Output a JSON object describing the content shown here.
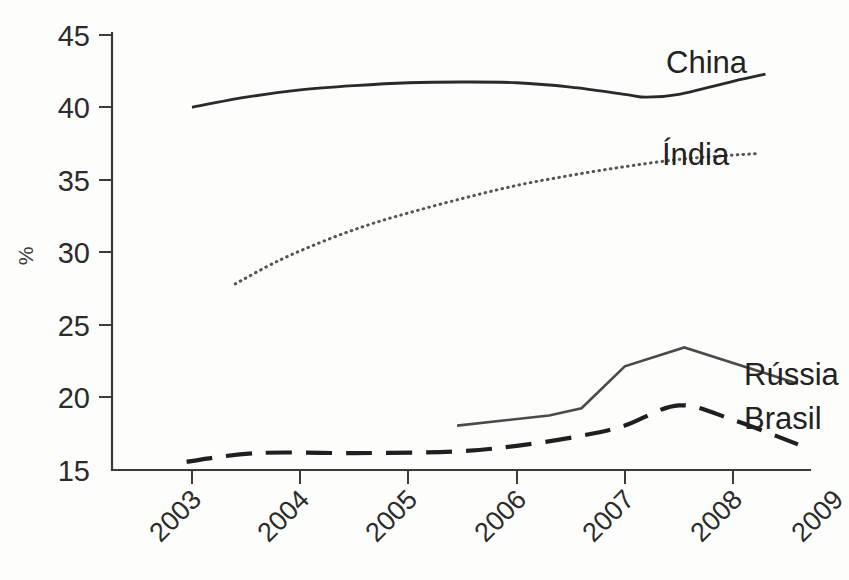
{
  "chart_data": {
    "type": "line",
    "title": "",
    "subtitle": "",
    "xlabel": "",
    "ylabel": "%",
    "xlim": [
      2003,
      2009
    ],
    "ylim": [
      15,
      45
    ],
    "grid": false,
    "legend_position": "right-inline",
    "x_ticks": [
      "2003",
      "2004",
      "2005",
      "2006",
      "2007",
      "2008",
      "2009"
    ],
    "y_ticks": [
      "15",
      "20",
      "25",
      "30",
      "35",
      "40",
      "45"
    ],
    "series": [
      {
        "name": "China",
        "style": "solid",
        "color": "#2a2a2a",
        "label_x": 2009.0,
        "label_value": 42.9,
        "x": [
          2003.0,
          2003.5,
          2004.0,
          2004.5,
          2005.0,
          2005.5,
          2006.0,
          2006.5,
          2007.0,
          2007.2,
          2007.5,
          2008.0,
          2008.3
        ],
        "values": [
          40.0,
          40.7,
          41.2,
          41.5,
          41.7,
          41.75,
          41.7,
          41.4,
          40.9,
          40.7,
          40.9,
          41.8,
          42.3
        ]
      },
      {
        "name": "Índia",
        "style": "dotted",
        "color": "#555555",
        "label_x": 2009.05,
        "label_value": 37.2,
        "x": [
          2003.4,
          2003.8,
          2004.2,
          2004.6,
          2005.0,
          2005.5,
          2006.0,
          2006.5,
          2007.0,
          2007.5,
          2008.0,
          2008.25
        ],
        "values": [
          27.8,
          29.4,
          30.7,
          31.8,
          32.7,
          33.7,
          34.6,
          35.3,
          35.9,
          36.4,
          36.7,
          36.8
        ]
      },
      {
        "name": "Rússia",
        "style": "solid",
        "color": "#4a4a4a",
        "label_x": 2009.1,
        "label_value": 21.2,
        "x": [
          2005.45,
          2006.3,
          2006.6,
          2007.0,
          2007.55,
          2008.6
        ],
        "values": [
          18.0,
          18.7,
          19.2,
          22.1,
          23.4,
          20.9
        ]
      },
      {
        "name": "Brasil",
        "style": "dashed",
        "color": "#1f1f1f",
        "label_x": 2009.1,
        "label_value": 18.5,
        "x": [
          2002.95,
          2003.6,
          2004.5,
          2005.4,
          2006.0,
          2006.6,
          2007.0,
          2007.5,
          2008.0,
          2008.6
        ],
        "values": [
          15.5,
          16.1,
          16.1,
          16.2,
          16.6,
          17.3,
          18.0,
          19.4,
          18.4,
          16.7
        ]
      }
    ]
  },
  "axes": {
    "y_axis_label": "%",
    "y_tick_labels": [
      "45",
      "40",
      "35",
      "30",
      "25",
      "20",
      "15"
    ],
    "x_tick_labels": [
      "2003",
      "2004",
      "2005",
      "2006",
      "2007",
      "2008",
      "2009"
    ]
  },
  "series_labels": {
    "china": "China",
    "india": "Índia",
    "russia": "Rússia",
    "brasil": "Brasil"
  }
}
